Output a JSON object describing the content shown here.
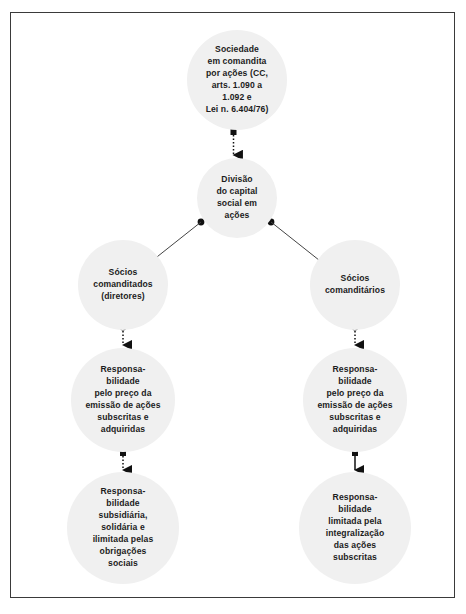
{
  "diagram": {
    "frame_color": "#3a3a3a",
    "node_fill_color": "#f0f0f0",
    "text_color": "#1c1c1c",
    "connector_color": "#111111",
    "nodes": {
      "top": {
        "label": "Sociedade\nem comandita\npor ações (CC,\narts. 1.090 a\n1.092 e\nLei n. 6.404/76)"
      },
      "division": {
        "label": "Divisão\ndo capital\nsocial em\nações"
      },
      "comanditados": {
        "label": "Sócios\ncomanditados\n(diretores)"
      },
      "comanditarios": {
        "label": "Sócios\ncomanditários"
      },
      "resp_left_mid": {
        "label": "Responsa-\nbilidade\npelo preço da\nemissão de ações\nsubscritas e\nadquiridas"
      },
      "resp_right_mid": {
        "label": "Responsa-\nbilidade\npelo preço da\nemissão de ações\nsubscritas e\nadquiridas"
      },
      "resp_left_bottom": {
        "label": "Responsa-\nbilidade\nsubsidiária,\nsolidária e\nilimitada pelas\nobrigações\nsociais"
      },
      "resp_right_bottom": {
        "label": "Responsa-\nbilidade\nlimitada pela\nintegralização\ndas ações\nsubscritas"
      }
    },
    "connectors": [
      {
        "id": "top-to-division",
        "style": "dotted",
        "from": "top",
        "to": "division",
        "start_marker": "square-dot",
        "end_marker": "arrowhead"
      },
      {
        "id": "division-to-comanditados",
        "style": "solid",
        "from": "division",
        "to": "comanditados",
        "start_marker": "round-dot",
        "end_marker": "arrowhead"
      },
      {
        "id": "division-to-comanditarios",
        "style": "solid",
        "from": "division",
        "to": "comanditarios",
        "start_marker": "round-dot",
        "end_marker": "arrowhead"
      },
      {
        "id": "comanditados-to-resp-left-mid",
        "style": "dotted",
        "from": "comanditados",
        "to": "resp_left_mid",
        "start_marker": "round-dot",
        "end_marker": "arrowhead"
      },
      {
        "id": "comanditarios-to-resp-right-mid",
        "style": "dotted",
        "from": "comanditarios",
        "to": "resp_right_mid",
        "start_marker": "round-dot",
        "end_marker": "arrowhead"
      },
      {
        "id": "resp-left-mid-to-resp-left-bottom",
        "style": "dotted",
        "from": "resp_left_mid",
        "to": "resp_left_bottom",
        "start_marker": "square-dot",
        "end_marker": "arrowhead"
      },
      {
        "id": "resp-right-mid-to-resp-right-bottom",
        "style": "solid",
        "from": "resp_right_mid",
        "to": "resp_right_bottom",
        "start_marker": "square-dot",
        "end_marker": "arrowhead"
      }
    ]
  }
}
